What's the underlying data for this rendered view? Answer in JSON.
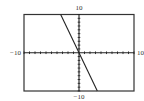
{
  "chart_data": {
    "type": "line",
    "title": "",
    "xlabel": "",
    "ylabel": "",
    "xlim": [
      -10,
      10
    ],
    "ylim": [
      -10,
      10
    ],
    "grid": false,
    "x_tick_step": 1,
    "y_tick_step": 1,
    "series": [
      {
        "name": "y = -3x",
        "x": [
          -3.333,
          3.333
        ],
        "y": [
          10,
          -10
        ]
      }
    ],
    "labels": {
      "x_min": "−10",
      "x_max": "10",
      "y_min": "−10",
      "y_max": "10"
    }
  },
  "colors": {
    "frame": "#333333",
    "axes": "#222222",
    "line": "#222222"
  }
}
